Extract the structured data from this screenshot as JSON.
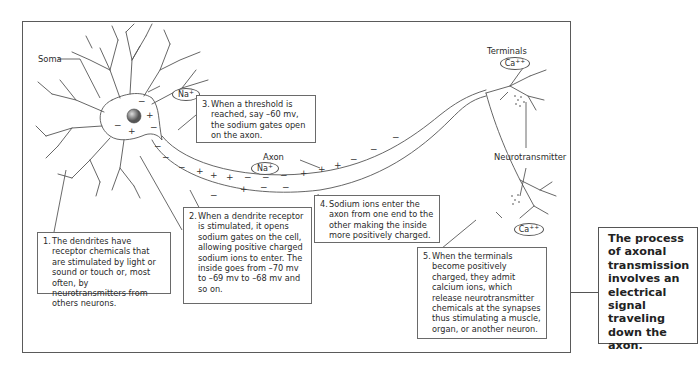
{
  "diagram": {
    "labels": {
      "soma": "Soma",
      "axon": "Axon",
      "terminals": "Terminals",
      "neurotransmitter": "Neurotransmitter"
    },
    "ions": {
      "na_soma": {
        "symbol": "Na",
        "charge": "+"
      },
      "na_dendrite": {
        "symbol": "Na",
        "charge": "+"
      },
      "na_axon": {
        "symbol": "Na",
        "charge": "+"
      },
      "ca_top": {
        "symbol": "Ca",
        "charge": "++"
      },
      "ca_bottom": {
        "symbol": "Ca",
        "charge": "++"
      }
    },
    "steps": [
      {
        "num": "1.",
        "text": "The dendrites have receptor chemicals that are stimulated by light or sound or touch or, most often, by neurotransmitters from others neurons."
      },
      {
        "num": "2.",
        "text": "When a dendrite receptor is stimulated, it opens sodium gates on the cell, allowing positive charged sodium ions to enter. The inside goes from –70 mv to –69 mv to –68 mv and so on."
      },
      {
        "num": "3.",
        "text": "When a threshold is reached, say –60 mv, the sodium gates open on the axon."
      },
      {
        "num": "4.",
        "text": "Sodium ions enter the axon from one end to the other making the inside more positively charged."
      },
      {
        "num": "5.",
        "text": "When the terminals become positively charged, they admit calcium ions, which release neurotransmitter chemicals at the synapses thus stimulating a muscle, organ, or another neuron."
      }
    ],
    "summary": "The process of axonal transmission involves an electrical signal traveling down the axon."
  }
}
